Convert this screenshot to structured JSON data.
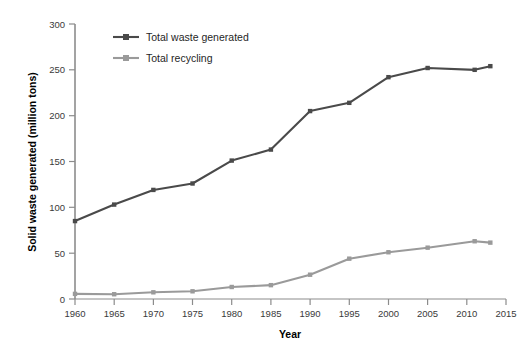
{
  "chart_data": {
    "type": "line",
    "title": "",
    "xlabel": "Year",
    "ylabel": "Solid waste generated (million tons)",
    "xlim": [
      1960,
      2015
    ],
    "ylim": [
      0,
      300
    ],
    "xticks": [
      "1960",
      "1965",
      "1970",
      "1975",
      "1980",
      "1985",
      "1990",
      "1995",
      "2000",
      "2005",
      "2010",
      "2015"
    ],
    "yticks": [
      "0",
      "50",
      "100",
      "150",
      "200",
      "250",
      "300"
    ],
    "grid": false,
    "legend_position": "top-left-inside",
    "x": [
      1960,
      1965,
      1970,
      1975,
      1980,
      1985,
      1990,
      1995,
      2000,
      2005,
      2011,
      2013
    ],
    "series": [
      {
        "name": "Total waste generated",
        "color": "#4a4a4a",
        "marker": "square",
        "values": [
          85,
          103,
          119,
          126,
          151,
          163,
          205,
          214,
          242,
          252,
          250,
          254
        ]
      },
      {
        "name": "Total recycling",
        "color": "#9a9a9a",
        "marker": "square",
        "values": [
          5.6,
          5.2,
          7.3,
          8.4,
          13.1,
          15.1,
          26.5,
          44.0,
          51.0,
          56.0,
          63.0,
          61.5
        ]
      }
    ]
  },
  "legend": {
    "items": [
      {
        "label": "Total waste generated",
        "color": "#4a4a4a"
      },
      {
        "label": "Total recycling",
        "color": "#9a9a9a"
      }
    ]
  },
  "axes": {
    "x_title": "Year",
    "y_title": "Solid waste generated (million tons)"
  },
  "colors": {
    "waste_line": "#4a4a4a",
    "recycling_line": "#9a9a9a",
    "axis": "#8c8c8c",
    "tick_label": "#3a3a3a",
    "background": "#ffffff"
  }
}
